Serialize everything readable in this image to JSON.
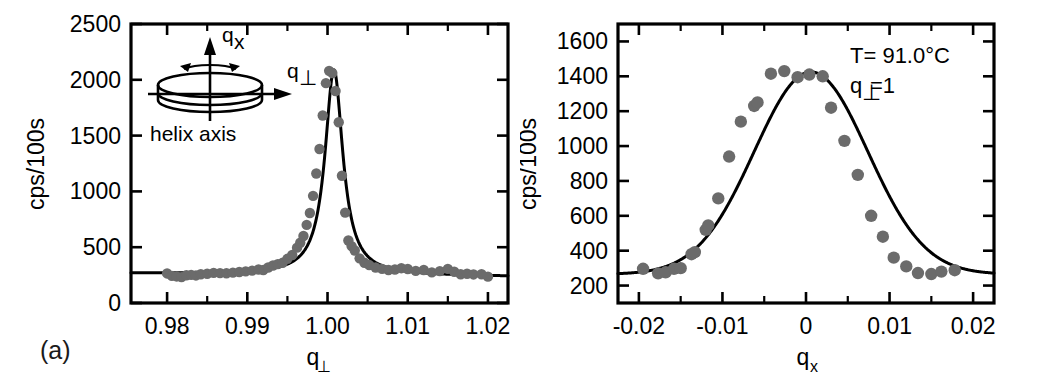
{
  "figure": {
    "panel_a_tag": "(a)",
    "panel_b_tag": "(b)"
  },
  "panel_a": {
    "ylabel": "cps/100s",
    "xlabel_base": "q",
    "xlabel_sub": "⊥",
    "inset": {
      "arrow_vertical_label_base": "q",
      "arrow_vertical_label_sub": "x",
      "arrow_horizontal_label_base": "q",
      "arrow_horizontal_label_sub": "⊥",
      "caption": "helix axis"
    }
  },
  "panel_b": {
    "ylabel": "cps/100s",
    "xlabel_base": "q",
    "xlabel_sub": "x",
    "annotation_temperature": "T= 91.0°C",
    "annotation_q_base": "q",
    "annotation_q_sub": "⊥",
    "annotation_q_value": "=1"
  },
  "chart_data": [
    {
      "panel": "(a)",
      "type": "scatter",
      "title": "",
      "xlabel": "q⊥",
      "ylabel": "cps/100s",
      "xlim": [
        0.9755,
        1.0225
      ],
      "ylim": [
        0,
        2500
      ],
      "xticks": [
        0.98,
        0.99,
        1.0,
        1.01,
        1.02
      ],
      "xticklabels": [
        "0.98",
        "0.99",
        "1.00",
        "1.01",
        "1.02"
      ],
      "yticks": [
        0,
        500,
        1000,
        1500,
        2000,
        2500
      ],
      "yticklabels": [
        "0",
        "500",
        "1000",
        "1500",
        "2000",
        "2500"
      ],
      "grid": false,
      "legend": null,
      "marker_color": "#6b6b6b",
      "fit_color": "#000000",
      "fit_model": "lorentzian_plus_background",
      "fit_params": {
        "peak_center": 1.0008,
        "peak_amplitude": 1840,
        "hwhm": 0.00135,
        "background": 250,
        "background_slope": -600
      },
      "points": [
        {
          "x": 0.98,
          "y": 265
        },
        {
          "x": 0.9806,
          "y": 243
        },
        {
          "x": 0.9812,
          "y": 238
        },
        {
          "x": 0.9818,
          "y": 232
        },
        {
          "x": 0.9824,
          "y": 248
        },
        {
          "x": 0.983,
          "y": 252
        },
        {
          "x": 0.9836,
          "y": 247
        },
        {
          "x": 0.9842,
          "y": 258
        },
        {
          "x": 0.985,
          "y": 262
        },
        {
          "x": 0.9858,
          "y": 270
        },
        {
          "x": 0.9866,
          "y": 268
        },
        {
          "x": 0.9874,
          "y": 266
        },
        {
          "x": 0.9882,
          "y": 272
        },
        {
          "x": 0.989,
          "y": 278
        },
        {
          "x": 0.9898,
          "y": 283
        },
        {
          "x": 0.9906,
          "y": 290
        },
        {
          "x": 0.9914,
          "y": 300
        },
        {
          "x": 0.992,
          "y": 296
        },
        {
          "x": 0.9926,
          "y": 318
        },
        {
          "x": 0.9932,
          "y": 336
        },
        {
          "x": 0.9938,
          "y": 348
        },
        {
          "x": 0.9944,
          "y": 360
        },
        {
          "x": 0.995,
          "y": 396
        },
        {
          "x": 0.9956,
          "y": 430
        },
        {
          "x": 0.9962,
          "y": 496
        },
        {
          "x": 0.9966,
          "y": 540
        },
        {
          "x": 0.997,
          "y": 600
        },
        {
          "x": 0.9974,
          "y": 700
        },
        {
          "x": 0.9978,
          "y": 806
        },
        {
          "x": 0.9982,
          "y": 960
        },
        {
          "x": 0.9986,
          "y": 1160
        },
        {
          "x": 0.999,
          "y": 1380
        },
        {
          "x": 0.9994,
          "y": 1680
        },
        {
          "x": 0.9998,
          "y": 1970
        },
        {
          "x": 1.0002,
          "y": 2080
        },
        {
          "x": 1.0006,
          "y": 2060
        },
        {
          "x": 1.001,
          "y": 1900
        },
        {
          "x": 1.0014,
          "y": 1620
        },
        {
          "x": 1.0018,
          "y": 1140
        },
        {
          "x": 1.0022,
          "y": 810
        },
        {
          "x": 1.0026,
          "y": 560
        },
        {
          "x": 1.003,
          "y": 510
        },
        {
          "x": 1.0034,
          "y": 470
        },
        {
          "x": 1.004,
          "y": 400
        },
        {
          "x": 1.0046,
          "y": 360
        },
        {
          "x": 1.0052,
          "y": 340
        },
        {
          "x": 1.006,
          "y": 318
        },
        {
          "x": 1.0068,
          "y": 306
        },
        {
          "x": 1.0076,
          "y": 296
        },
        {
          "x": 1.0084,
          "y": 300
        },
        {
          "x": 1.0092,
          "y": 312
        },
        {
          "x": 1.01,
          "y": 305
        },
        {
          "x": 1.011,
          "y": 288
        },
        {
          "x": 1.012,
          "y": 296
        },
        {
          "x": 1.013,
          "y": 274
        },
        {
          "x": 1.014,
          "y": 286
        },
        {
          "x": 1.015,
          "y": 306
        },
        {
          "x": 1.0158,
          "y": 280
        },
        {
          "x": 1.0166,
          "y": 258
        },
        {
          "x": 1.0174,
          "y": 262
        },
        {
          "x": 1.0182,
          "y": 256
        },
        {
          "x": 1.0192,
          "y": 258
        },
        {
          "x": 1.02,
          "y": 236
        }
      ]
    },
    {
      "panel": "(b)",
      "type": "scatter",
      "title": "",
      "xlabel": "qx",
      "ylabel": "cps/100s",
      "xlim": [
        -0.0225,
        0.0225
      ],
      "ylim": [
        100,
        1700
      ],
      "xticks": [
        -0.02,
        -0.01,
        0,
        0.01,
        0.02
      ],
      "xticklabels": [
        "-0.02",
        "-0.01",
        "0",
        "0.01",
        "0.02"
      ],
      "yticks": [
        200,
        400,
        600,
        800,
        1000,
        1200,
        1400,
        1600
      ],
      "yticklabels": [
        "200",
        "400",
        "600",
        "800",
        "1000",
        "1200",
        "1400",
        "1600"
      ],
      "grid": false,
      "legend": null,
      "marker_color": "#6b6b6b",
      "fit_color": "#000000",
      "fit_model": "gaussian_plus_background",
      "fit_params": {
        "peak_center": 0.0006,
        "peak_amplitude": 1160,
        "sigma": 0.0068,
        "background": 265
      },
      "annotations": [
        "T= 91.0°C",
        "q⊥=1"
      ],
      "points": [
        {
          "x": -0.0195,
          "y": 296
        },
        {
          "x": -0.0177,
          "y": 270
        },
        {
          "x": -0.0168,
          "y": 276
        },
        {
          "x": -0.0158,
          "y": 296
        },
        {
          "x": -0.015,
          "y": 300
        },
        {
          "x": -0.0137,
          "y": 380
        },
        {
          "x": -0.0133,
          "y": 392
        },
        {
          "x": -0.012,
          "y": 520
        },
        {
          "x": -0.0117,
          "y": 545
        },
        {
          "x": -0.0105,
          "y": 700
        },
        {
          "x": -0.0092,
          "y": 940
        },
        {
          "x": -0.0078,
          "y": 1140
        },
        {
          "x": -0.0062,
          "y": 1230
        },
        {
          "x": -0.0058,
          "y": 1250
        },
        {
          "x": -0.0042,
          "y": 1415
        },
        {
          "x": -0.0026,
          "y": 1430
        },
        {
          "x": -0.001,
          "y": 1395
        },
        {
          "x": 0.0004,
          "y": 1410
        },
        {
          "x": 0.002,
          "y": 1400
        },
        {
          "x": 0.003,
          "y": 1220
        },
        {
          "x": 0.0046,
          "y": 1030
        },
        {
          "x": 0.0062,
          "y": 835
        },
        {
          "x": 0.0078,
          "y": 600
        },
        {
          "x": 0.0092,
          "y": 480
        },
        {
          "x": 0.0105,
          "y": 360
        },
        {
          "x": 0.012,
          "y": 310
        },
        {
          "x": 0.0134,
          "y": 272
        },
        {
          "x": 0.015,
          "y": 266
        },
        {
          "x": 0.0162,
          "y": 280
        },
        {
          "x": 0.0178,
          "y": 288
        }
      ]
    }
  ]
}
